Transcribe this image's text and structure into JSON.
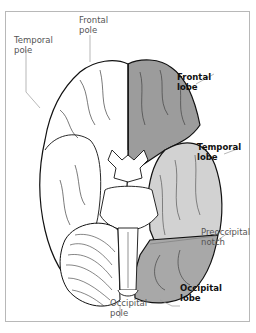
{
  "figure": {
    "labels": {
      "frontal_pole": {
        "line1": "Frontal",
        "line2": "pole",
        "bold": false
      },
      "temporal_pole": {
        "line1": "Temporal",
        "line2": "pole",
        "bold": false
      },
      "frontal_lobe": {
        "line1": "Frontal",
        "line2": "lobe",
        "bold": true
      },
      "temporal_lobe": {
        "line1": "Temporal",
        "line2": "lobe",
        "bold": true
      },
      "preoccipital_notch": {
        "line1": "Preoccipital",
        "line2": "notch",
        "bold": false
      },
      "occipital_lobe": {
        "line1": "Occipital",
        "line2": "lobe",
        "bold": true
      },
      "occipital_pole": {
        "line1": "Occipital",
        "line2": "pole",
        "bold": false
      }
    },
    "colors": {
      "frontal_lobe_fill": "#9c9c9c",
      "temporal_lobe_fill": "#d2d2d2",
      "occipital_lobe_fill": "#a8a8a8",
      "left_hemisphere_fill": "#ffffff",
      "outline": "#111111",
      "leader_line": "#9a9a9a",
      "frame_border": "#b8b8b8"
    }
  }
}
